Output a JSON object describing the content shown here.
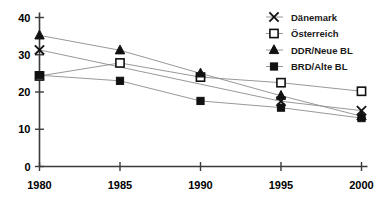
{
  "chart_data": {
    "type": "line",
    "title": "",
    "xlabel": "",
    "ylabel": "",
    "x": [
      1980,
      1985,
      1990,
      1995,
      2000
    ],
    "categories": [
      "1980",
      "1985",
      "1990",
      "1995",
      "2000"
    ],
    "xlim": [
      1980,
      2000
    ],
    "ylim": [
      0,
      40
    ],
    "yticks": [
      0,
      10,
      20,
      30,
      40
    ],
    "ytick_labels": [
      "0",
      "10",
      "20",
      "30",
      "40"
    ],
    "xtick_labels": [
      "1980",
      "1985",
      "1990",
      "1995",
      "2000"
    ],
    "grid": false,
    "legend_position": "top-right",
    "series": [
      {
        "name": "Dänemark",
        "marker": "cross",
        "values": [
          31.3,
          null,
          null,
          17.5,
          15.0
        ],
        "marker_years": [
          1980,
          1995,
          2000
        ]
      },
      {
        "name": "Österreich",
        "marker": "open-square",
        "values": [
          24.3,
          27.8,
          24.0,
          22.5,
          20.2
        ],
        "marker_years": [
          1980,
          1985,
          1990,
          1995,
          2000
        ]
      },
      {
        "name": "DDR/Neue BL",
        "marker": "filled-triangle",
        "values": [
          35.2,
          31.2,
          25.0,
          19.0,
          13.5
        ],
        "marker_years": [
          1980,
          1985,
          1990,
          1995,
          2000
        ]
      },
      {
        "name": "BRD/Alte BL",
        "marker": "filled-square",
        "values": [
          24.5,
          23.0,
          17.6,
          15.8,
          13.0
        ],
        "marker_years": [
          1980,
          1985,
          1990,
          1995,
          2000
        ]
      }
    ],
    "colors": {
      "line": "#8c8c8c",
      "marker": "#111111",
      "axis": "#3b3b3b",
      "text": "#000000",
      "background": "#ffffff"
    }
  },
  "legend": {
    "entries": [
      {
        "label": "Dänemark",
        "marker": "cross"
      },
      {
        "label": "Österreich",
        "marker": "open-square"
      },
      {
        "label": "DDR/Neue BL",
        "marker": "filled-triangle"
      },
      {
        "label": "BRD/Alte BL",
        "marker": "filled-square"
      }
    ]
  }
}
